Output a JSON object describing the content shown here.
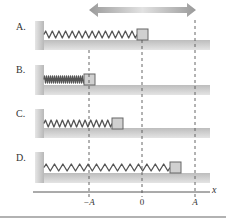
{
  "figure": {
    "arrow": {
      "x1": 89,
      "x2": 196,
      "y": 10,
      "direction": "both",
      "meaning": "oscillation"
    },
    "reference_lines": [
      {
        "label": "−A",
        "x": 89
      },
      {
        "label": "0",
        "x": 142
      },
      {
        "label": "A",
        "x": 195
      }
    ],
    "axis": {
      "label": "x",
      "y": 192,
      "x_start": 33,
      "x_end": 210
    },
    "rows": [
      {
        "label": "A.",
        "label_y": 22,
        "wall_top": 21,
        "floor_top": 40,
        "block_x": 137,
        "block_y": 29,
        "spring_state": "stretched-to-zero",
        "coils": 14
      },
      {
        "label": "B.",
        "label_y": 65,
        "wall_top": 65,
        "floor_top": 85,
        "block_x": 84,
        "block_y": 74,
        "spring_state": "compressed",
        "coils": 20
      },
      {
        "label": "C.",
        "label_y": 109,
        "wall_top": 109,
        "floor_top": 128,
        "block_x": 112,
        "block_y": 118,
        "spring_state": "slightly-compressed",
        "coils": 12
      },
      {
        "label": "D.",
        "label_y": 153,
        "wall_top": 152,
        "floor_top": 173,
        "block_x": 170,
        "block_y": 162,
        "spring_state": "stretched",
        "coils": 15
      }
    ],
    "colors": {
      "floor": "#c8c8c8",
      "wall": "#c0c0c0",
      "spring": "#555555",
      "block_fill": "#d0d0d0",
      "block_stroke": "#666666",
      "dashed": "#555555",
      "arrow": "#a6a6a6",
      "axis": "#444444",
      "separator": "#999999"
    }
  },
  "labels": {
    "row_a": "A.",
    "row_b": "B.",
    "row_c": "C.",
    "row_d": "D.",
    "tick_neg_a": "−A",
    "tick_zero": "0",
    "tick_a": "A",
    "axis_x": "x"
  }
}
